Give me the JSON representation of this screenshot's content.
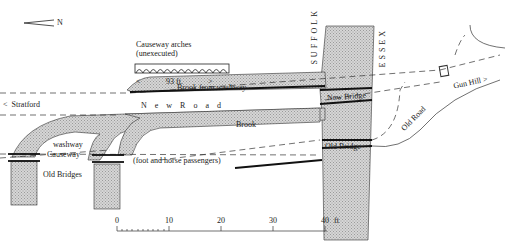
{
  "map": {
    "north_arrow": "N",
    "counties": {
      "west": "SUFFOLK",
      "east": "ESSEX"
    },
    "labels": {
      "causeway_arches": "Causeway arches",
      "unexecuted": "(unexecuted)",
      "arch_span": "93 ft.",
      "brook_from_washway": "Brook from washway",
      "stratford": "Stratford",
      "new_road": "N e w   R o a d",
      "new_bridge": "New Bridge",
      "gun_hill": "Gun Hill",
      "old_road": "Old Road",
      "brook": "Brook",
      "washway": "washway",
      "causeway": "Causeway",
      "old_bridges": "Old Bridges",
      "foot_horse": "(foot and horse passengers)",
      "old_bridge": "Old Bridge"
    },
    "scale": {
      "ticks": [
        "0",
        "10",
        "20",
        "30",
        "40"
      ],
      "unit": "ft"
    },
    "colors": {
      "water": "#c8c8c8",
      "ink": "#222222"
    }
  }
}
